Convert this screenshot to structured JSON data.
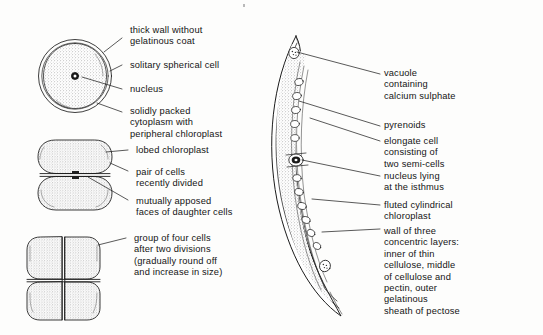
{
  "figure": {
    "background_color": "#fdfdfc",
    "ink_color": "#141414",
    "stipple_color": "#8c8c8c"
  },
  "left_column": {
    "labels": [
      {
        "id": "thick-wall",
        "text": "thick wall without\ngelatinous coat"
      },
      {
        "id": "solitary-cell",
        "text": "solitary spherical cell"
      },
      {
        "id": "nucleus",
        "text": "nucleus"
      },
      {
        "id": "cytoplasm",
        "text": "solidly packed\ncytoplasm with\nperipheral chloroplast"
      },
      {
        "id": "lobed-chloroplast",
        "text": "lobed chloroplast"
      },
      {
        "id": "pair-of-cells",
        "text": "pair of cells\nrecently divided"
      },
      {
        "id": "apposed-faces",
        "text": "mutually apposed\nfaces of daughter cells"
      },
      {
        "id": "four-cells",
        "text": "group of four cells\nafter two divisions\n(gradually round off\nand increase in size)"
      }
    ],
    "drawings": [
      {
        "id": "single-spherical-cell",
        "stage": "one cell"
      },
      {
        "id": "two-celled-stage",
        "stage": "two cells"
      },
      {
        "id": "four-celled-stage",
        "stage": "four cells"
      }
    ]
  },
  "right_column": {
    "labels": [
      {
        "id": "vacuole",
        "text": "vacuole\ncontaining\ncalcium sulphate"
      },
      {
        "id": "pyrenoids",
        "text": "pyrenoids"
      },
      {
        "id": "elongate-cell",
        "text": "elongate cell\nconsisting of\ntwo semi-cells"
      },
      {
        "id": "nucleus-isthmus",
        "text": "nucleus lying\nat the isthmus"
      },
      {
        "id": "fluted-chloroplast",
        "text": "fluted cylindrical\nchloroplast"
      },
      {
        "id": "wall-layers",
        "text": "wall of three\nconcentric layers:\ninner of thin\ncellulose, middle\nof cellulose and\npectin, outer\ngelatinous\nsheath of pectose"
      }
    ],
    "drawings": [
      {
        "id": "crescent-closterium-cell",
        "stage": "mature crescent cell"
      }
    ]
  }
}
